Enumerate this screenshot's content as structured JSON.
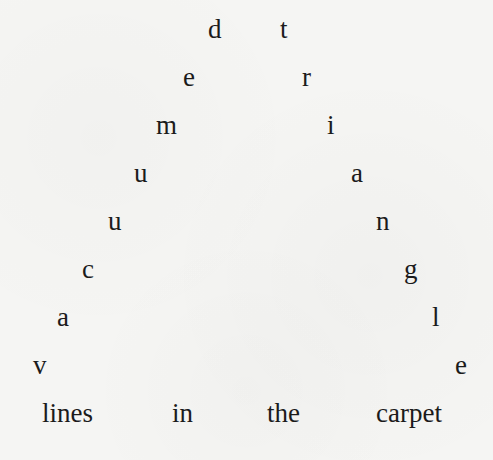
{
  "poem": {
    "title_words": [
      "lines",
      "in",
      "the",
      "carpet"
    ],
    "left_arm": [
      "d",
      "e",
      "m",
      "u",
      "u",
      "c",
      "a",
      "v"
    ],
    "right_arm": [
      "t",
      "r",
      "i",
      "a",
      "n",
      "g",
      "l",
      "e"
    ],
    "left_arm_reading": "vacuumed",
    "right_arm_reading": "triangle",
    "bottom_line": "lines in the carpet",
    "colors": {
      "background": "#f5f5f3",
      "text": "#1b1b1b"
    }
  }
}
